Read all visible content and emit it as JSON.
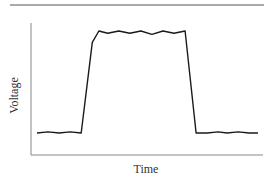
{
  "chart_data": {
    "type": "line",
    "title": "",
    "xlabel": "Time",
    "ylabel": "Voltage",
    "grid": false,
    "legend": null,
    "series": [
      {
        "name": "Voltage pulse",
        "x": [
          0,
          5,
          10,
          15,
          20,
          25,
          28,
          32,
          37,
          42,
          47,
          52,
          57,
          62,
          67,
          72,
          77,
          82,
          86,
          91,
          96,
          100
        ],
        "y": [
          0.05,
          0.06,
          0.05,
          0.06,
          0.05,
          0.85,
          0.95,
          0.93,
          0.95,
          0.93,
          0.95,
          0.92,
          0.95,
          0.93,
          0.95,
          0.05,
          0.05,
          0.06,
          0.05,
          0.06,
          0.05,
          0.05
        ]
      }
    ],
    "xlim": [
      0,
      100
    ],
    "ylim": [
      0,
      1
    ],
    "tick_labels": "none",
    "annotations": []
  },
  "labels": {
    "x_axis": "Time",
    "y_axis": "Voltage"
  },
  "colors": {
    "line": "#1a1a1a",
    "axis": "#777777",
    "top_rule": "#444444",
    "background": "#ffffff"
  }
}
